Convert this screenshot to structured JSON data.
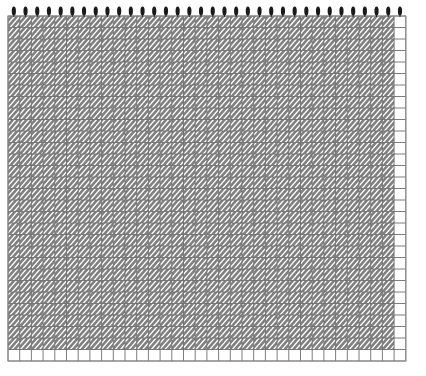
{
  "figure": {
    "type": "hatched-grid-pattern",
    "title": "",
    "width": 426,
    "height": 376,
    "background_color": "#ffffff"
  },
  "canvas": {
    "margin_left": 8,
    "margin_top": 5,
    "margin_right": 12,
    "margin_bottom": 12,
    "plot_x": 8,
    "plot_y": 16,
    "plot_width": 406,
    "plot_height": 352
  },
  "grid": {
    "columns": 34,
    "rows": 30,
    "cell_width": 11.7,
    "cell_height": 11.5,
    "line_color": "#6e6e6e",
    "line_width": 0.9,
    "outer_border_color": "#8a8a8a",
    "outer_border_width": 1
  },
  "hatch": {
    "style": "diagonal-45-up",
    "stroke_color": "#808080",
    "stroke_width": 2.6,
    "spacing": 5.2,
    "angle_degrees": 45,
    "fill_color": "#ffffff",
    "description": "45-degree diagonal stripes rising left-to-right, staggered per cell producing a houndstooth weave",
    "skip_last_column": true,
    "skip_last_row": true,
    "offset_cycle": [
      0,
      2,
      4,
      1,
      3
    ]
  },
  "top_markers": {
    "shape": "vertical-ellipse",
    "count": 34,
    "color": "#1a1a1a",
    "radius_x": 2.1,
    "radius_y": 4.6,
    "center_y": 11,
    "stem_color": "#2b2b2b",
    "stem_width": 1,
    "stem_height": 6
  },
  "legend": {
    "visible": false,
    "entries": []
  },
  "axes": {
    "x_label": "",
    "y_label": "",
    "x_ticks": [],
    "y_ticks": [],
    "visible_labels": false
  },
  "chart_data": {
    "type": "heatmap",
    "title": "",
    "xlabel": "",
    "ylabel": "",
    "categories": [],
    "values": [],
    "grid": true,
    "legend_position": "none",
    "note": "Uniform hatched grid; no numeric data labels are rendered in the image."
  }
}
